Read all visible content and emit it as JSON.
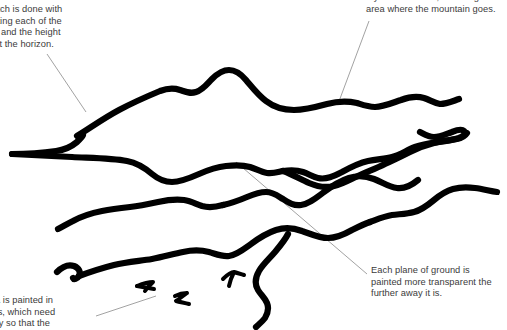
{
  "document": {
    "kind": "annotated-landscape-sketch",
    "width": 507,
    "height": 330,
    "background_color": "#ffffff",
    "ink_color": "#000000",
    "text_color": "#3b3b3b",
    "leader_line_color": "#8a8a8a"
  },
  "annotations": [
    {
      "id": "initial-sketch",
      "clipped": "left",
      "lines": [
        "itial sketch is done with",
        "cil, locating each of the",
        "masses and the height",
        " water at the horizon."
      ],
      "text": "itial sketch is done with\ncil, locating each of the\nmasses and the height\n water at the horizon."
    },
    {
      "id": "yellowish-wash",
      "clipped": "top",
      "lines": [
        "a yellowish wash, including the",
        "area where the mountain goes."
      ],
      "text": "a yellowish wash, including the\narea where the mountain goes."
    },
    {
      "id": "each-plane",
      "clipped": "none",
      "lines": [
        "Each plane of ground is",
        "painted more transparent the",
        "further away it is."
      ],
      "text": "Each plane of ground is\npainted more transparent the\nfurther away it is."
    },
    {
      "id": "sea-layers",
      "clipped": "left-bottom",
      "lines": [
        "he sea is painted in",
        "t layers, which need",
        "ft to dry so that the"
      ],
      "text": "he sea is painted in\nt layers, which need\nft to dry so that the"
    }
  ],
  "leader_lines": [
    {
      "id": "leader-initial-sketch",
      "from": [
        47,
        54
      ],
      "to": [
        86,
        112
      ]
    },
    {
      "id": "leader-yellowish-wash",
      "from": [
        369,
        21
      ],
      "to": [
        338,
        104
      ]
    },
    {
      "id": "leader-each-plane",
      "from": [
        236,
        162
      ],
      "to": [
        367,
        274
      ]
    },
    {
      "id": "leader-sea-layers",
      "from": [
        96,
        316
      ],
      "to": [
        156,
        296
      ]
    }
  ],
  "sketch_strokes": [
    {
      "id": "mountain-ridge",
      "role": "far mountain / hill mass silhouette"
    },
    {
      "id": "horizon-line",
      "role": "horizon water line at left"
    },
    {
      "id": "mid-ground-plane",
      "role": "middle ground plane edge"
    },
    {
      "id": "second-ridge",
      "role": "second distant ridge rising to the right"
    },
    {
      "id": "near-ground-plane",
      "role": "near ground plane edge"
    },
    {
      "id": "lower-bank",
      "role": "lower shore bank"
    },
    {
      "id": "shore-curve",
      "role": "curving foreground shoreline"
    },
    {
      "id": "bird-mark-1",
      "role": "small bird mark"
    },
    {
      "id": "bird-mark-2",
      "role": "small bird mark"
    },
    {
      "id": "bird-mark-3",
      "role": "small bird mark"
    }
  ]
}
